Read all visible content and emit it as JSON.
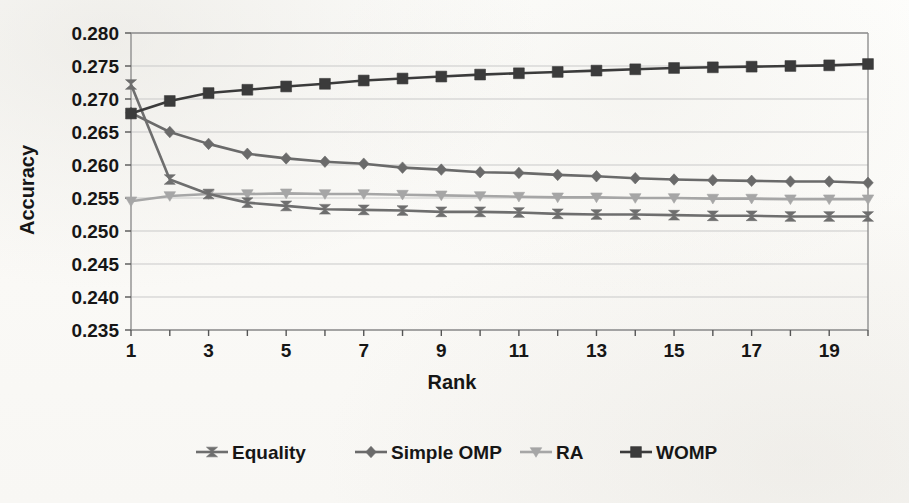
{
  "figure": {
    "background_color": "#fbfbf9",
    "plot_border_color": "#8f8f8f",
    "gridline_color": "#c9c9c9"
  },
  "chart_data": {
    "type": "line",
    "title": "",
    "xlabel": "Rank",
    "ylabel": "Accuracy",
    "xlim": [
      1,
      20
    ],
    "ylim": [
      0.235,
      0.28
    ],
    "ytick_step": 0.005,
    "grid": true,
    "grid_axis": "y",
    "legend_position": "bottom",
    "x": [
      1,
      2,
      3,
      4,
      5,
      6,
      7,
      8,
      9,
      10,
      11,
      12,
      13,
      14,
      15,
      16,
      17,
      18,
      19,
      20
    ],
    "xtick_labels": [
      "1",
      "",
      "3",
      "",
      "5",
      "",
      "7",
      "",
      "9",
      "",
      "11",
      "",
      "13",
      "",
      "15",
      "",
      "17",
      "",
      "19",
      ""
    ],
    "ytick_labels": [
      "0.235",
      "0.240",
      "0.245",
      "0.250",
      "0.255",
      "0.260",
      "0.265",
      "0.270",
      "0.275",
      "0.280"
    ],
    "ytick_values": [
      0.235,
      0.24,
      0.245,
      0.25,
      0.255,
      0.26,
      0.265,
      0.27,
      0.275,
      0.28
    ],
    "series": [
      {
        "name": "Equality",
        "color": "#6e6e6e",
        "marker": "bowtie",
        "values": [
          0.2722,
          0.2578,
          0.2556,
          0.2543,
          0.2538,
          0.2533,
          0.2532,
          0.2531,
          0.2529,
          0.2529,
          0.2528,
          0.2526,
          0.2525,
          0.2525,
          0.2524,
          0.2523,
          0.2523,
          0.2522,
          0.2522,
          0.2522
        ]
      },
      {
        "name": "Simple OMP",
        "color": "#6a6a6a",
        "marker": "diamond",
        "values": [
          0.2679,
          0.265,
          0.2632,
          0.2617,
          0.261,
          0.2605,
          0.2602,
          0.2596,
          0.2593,
          0.2589,
          0.2588,
          0.2585,
          0.2583,
          0.258,
          0.2578,
          0.2577,
          0.2576,
          0.2575,
          0.2575,
          0.2573
        ]
      },
      {
        "name": "RA",
        "color": "#a6a6a6",
        "marker": "triangle-down",
        "values": [
          0.2545,
          0.2553,
          0.2556,
          0.2556,
          0.2557,
          0.2556,
          0.2556,
          0.2555,
          0.2554,
          0.2553,
          0.2552,
          0.2551,
          0.2551,
          0.255,
          0.255,
          0.2549,
          0.2549,
          0.2548,
          0.2548,
          0.2548
        ]
      },
      {
        "name": "WOMP",
        "color": "#3b3b3b",
        "marker": "square",
        "values": [
          0.2678,
          0.2697,
          0.2709,
          0.2714,
          0.2719,
          0.2723,
          0.2728,
          0.2731,
          0.2734,
          0.2737,
          0.2739,
          0.2741,
          0.2743,
          0.2745,
          0.2747,
          0.2748,
          0.2749,
          0.275,
          0.2751,
          0.2753
        ]
      }
    ]
  },
  "legend": {
    "items": [
      {
        "label": "Equality"
      },
      {
        "label": "Simple OMP"
      },
      {
        "label": "RA"
      },
      {
        "label": "WOMP"
      }
    ]
  }
}
